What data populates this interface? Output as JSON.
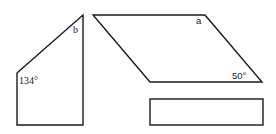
{
  "diagram": {
    "stroke_color": "#1a1a1a",
    "background_color": "#ffffff",
    "shapes": [
      {
        "id": "trapezoid",
        "type": "right-trapezoid",
        "vertices": [
          [
            17,
            73
          ],
          [
            83,
            15
          ],
          [
            83,
            125
          ],
          [
            17,
            125
          ]
        ],
        "labels": [
          {
            "text": "b",
            "position": "top-right interior angle"
          },
          {
            "text": "134°",
            "position": "upper-left interior angle"
          }
        ]
      },
      {
        "id": "parallelogram",
        "type": "parallelogram",
        "vertices": [
          [
            93,
            15
          ],
          [
            205,
            15
          ],
          [
            262,
            82
          ],
          [
            150,
            82
          ]
        ],
        "labels": [
          {
            "text": "a",
            "position": "top-right interior angle"
          },
          {
            "text": "50°",
            "position": "bottom-right interior angle"
          }
        ]
      },
      {
        "id": "rectangle",
        "type": "rectangle",
        "vertices": [
          [
            150,
            99
          ],
          [
            263,
            99
          ],
          [
            263,
            125
          ],
          [
            150,
            125
          ]
        ],
        "labels": []
      }
    ]
  }
}
